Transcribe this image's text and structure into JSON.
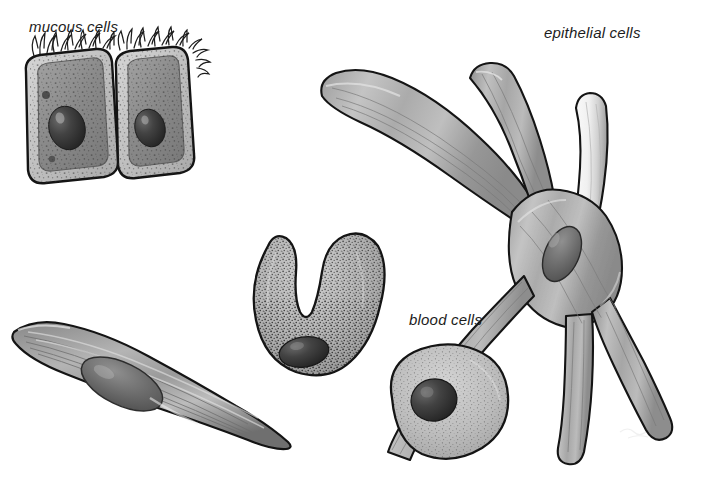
{
  "figure": {
    "background_color": "#ffffff",
    "width": 701,
    "height": 479,
    "style": "grayscale pen-and-ink scientific illustration"
  },
  "labels": {
    "mucous": "mucous cells",
    "epithelial": "epithelial cells",
    "blood": "blood cells"
  },
  "palette": {
    "ink": "#141414",
    "label_text": "#1c1c1c",
    "background": "#ffffff",
    "membrane_light": "#c9c9c9",
    "cytoplasm_mid": "#8f8f8f",
    "cytoplasm_dark": "#6e6e6e",
    "nucleus_dark": "#3a3a3a",
    "nucleus_darkest": "#262626",
    "highlight": "#e8e8e8",
    "epithelial_light_arm": "#f2f2f2"
  },
  "cells": [
    {
      "id": "mucous-cells",
      "name": "mucous cells",
      "label_position": {
        "x": 29,
        "y": 19
      },
      "count": 2,
      "shape": "rounded rectangular columnar cells, side by side, slightly tilted",
      "features": [
        "apical cilia tufts",
        "thick outer membrane ring",
        "speckled cytoplasm",
        "dark oval nucleus"
      ],
      "bounds": {
        "x": 18,
        "y": 40,
        "width": 170,
        "height": 145
      }
    },
    {
      "id": "epithelial-cells",
      "name": "epithelial cells",
      "label_position": {
        "x": 544,
        "y": 25
      },
      "count": 1,
      "shape": "branched stellate cell with five tapered arms radiating from a central body",
      "features": [
        "longitudinal striations",
        "elongated oval nucleus at branch junction",
        "one pale outlined arm upper-right"
      ],
      "bounds": {
        "x": 320,
        "y": 62,
        "width": 360,
        "height": 395
      }
    },
    {
      "id": "muscle-spindle-cell",
      "name": "spindle cell",
      "label_position": null,
      "count": 1,
      "shape": "elongated spindle / fusiform cell with tapered pointed ends",
      "features": [
        "longitudinal striations",
        "central elongated oval nucleus",
        "dark shading along lower edge"
      ],
      "bounds": {
        "x": 10,
        "y": 318,
        "width": 285,
        "height": 130
      }
    },
    {
      "id": "granulocyte-blood-cell",
      "name": "U-shaped granular blood cell",
      "label_position": null,
      "count": 1,
      "shape": "horseshoe / U-shaped cell opening upward",
      "features": [
        "dense dark stippled granules",
        "dark oval nucleus at lower left of the U"
      ],
      "bounds": {
        "x": 248,
        "y": 228,
        "width": 145,
        "height": 148
      }
    },
    {
      "id": "round-blood-cell",
      "name": "round blood cell",
      "label_position": {
        "x": 409,
        "y": 312
      },
      "count": 1,
      "shape": "rounded, slightly irregular circular cell",
      "features": [
        "fine stippled cytoplasm",
        "dark round nucleus offset to the left"
      ],
      "bounds": {
        "x": 382,
        "y": 345,
        "width": 128,
        "height": 118
      }
    }
  ]
}
